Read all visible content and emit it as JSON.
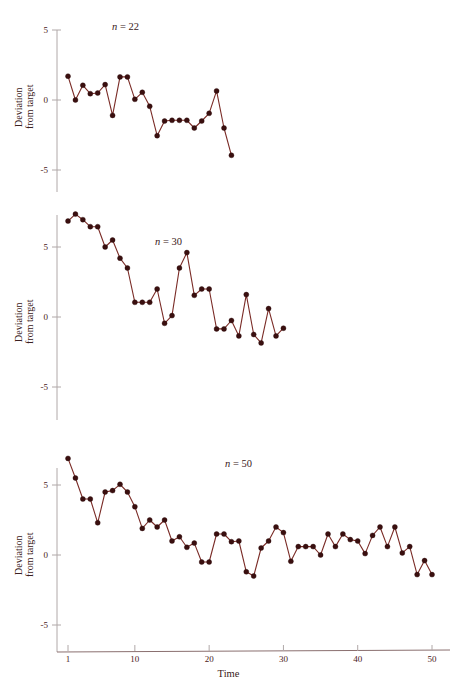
{
  "figure": {
    "xlabel": "Time",
    "ylabel_line1": "Deviation",
    "ylabel_line2": "from target"
  },
  "chart_data": [
    {
      "type": "line",
      "title": "n = 22",
      "title_var": "n",
      "title_rest": " = 22",
      "n": 22,
      "xlabel": "",
      "ylabel": "Deviation from target",
      "xlim": [
        1,
        50
      ],
      "ylim": [
        -7.2,
        7.2
      ],
      "yticks": [
        5,
        0,
        -5
      ],
      "ytick_labels": [
        "5",
        "0",
        "-5"
      ],
      "grid": false,
      "legend": "none",
      "x": [
        1,
        2,
        3,
        4,
        5,
        6,
        7,
        8,
        9,
        10,
        11,
        12,
        13,
        14,
        15,
        16,
        17,
        18,
        19,
        20,
        21,
        22
      ],
      "values": [
        1.7,
        0.0,
        1.05,
        0.45,
        0.5,
        1.1,
        -1.1,
        1.65,
        1.65,
        0.05,
        0.55,
        -0.45,
        -2.55,
        -1.5,
        -1.45,
        -1.45,
        -1.45,
        -2.0,
        -1.5,
        -0.95,
        0.65,
        -2.0
      ],
      "extra_point": {
        "x": 23,
        "value": -3.95
      }
    },
    {
      "type": "line",
      "title": "n = 30",
      "title_var": "n",
      "title_rest": " = 30",
      "n": 30,
      "xlabel": "",
      "ylabel": "Deviation from target",
      "xlim": [
        1,
        50
      ],
      "ylim": [
        -7.2,
        7.2
      ],
      "yticks": [
        5,
        0,
        -5
      ],
      "ytick_labels": [
        "5",
        "0",
        "-5"
      ],
      "grid": false,
      "legend": "none",
      "x": [
        1,
        2,
        3,
        4,
        5,
        6,
        7,
        8,
        9,
        10,
        11,
        12,
        13,
        14,
        15,
        16,
        17,
        18,
        19,
        20,
        21,
        22,
        23,
        24,
        25,
        26,
        27,
        28,
        29,
        30
      ],
      "values": [
        6.85,
        7.35,
        6.95,
        6.45,
        6.45,
        5.0,
        5.5,
        4.2,
        3.5,
        1.05,
        1.05,
        1.05,
        2.0,
        -0.45,
        0.1,
        3.5,
        4.6,
        1.55,
        2.0,
        2.0,
        -0.85,
        -0.85,
        -0.25,
        -1.35,
        1.6,
        -1.25,
        -1.85,
        0.6,
        -1.35,
        -0.8
      ]
    },
    {
      "type": "line",
      "title": "n = 50",
      "title_var": "n",
      "title_rest": " = 50",
      "n": 50,
      "xlabel": "Time",
      "ylabel": "Deviation from target",
      "xlim": [
        1,
        50
      ],
      "ylim": [
        -7.2,
        7.2
      ],
      "yticks": [
        5,
        0,
        -5
      ],
      "ytick_labels": [
        "5",
        "0",
        "-5"
      ],
      "xticks": [
        1,
        10,
        20,
        30,
        40,
        50
      ],
      "xtick_labels": [
        "1",
        "10",
        "20",
        "30",
        "40",
        "50"
      ],
      "grid": false,
      "legend": "none",
      "x": [
        1,
        2,
        3,
        4,
        5,
        6,
        7,
        8,
        9,
        10,
        11,
        12,
        13,
        14,
        15,
        16,
        17,
        18,
        19,
        20,
        21,
        22,
        23,
        24,
        25,
        26,
        27,
        28,
        29,
        30,
        31,
        32,
        33,
        34,
        35,
        36,
        37,
        38,
        39,
        40,
        41,
        42,
        43,
        44,
        45,
        46,
        47,
        48,
        49,
        50
      ],
      "values": [
        6.9,
        5.5,
        4.0,
        4.0,
        2.3,
        4.5,
        4.6,
        5.05,
        4.5,
        3.45,
        1.9,
        2.5,
        2.0,
        2.5,
        1.0,
        1.3,
        0.55,
        0.85,
        -0.5,
        -0.5,
        1.5,
        1.5,
        0.95,
        1.0,
        -1.2,
        -1.5,
        0.5,
        1.0,
        2.0,
        1.6,
        -0.45,
        0.6,
        0.6,
        0.6,
        0.0,
        1.5,
        0.6,
        1.5,
        1.1,
        1.0,
        0.1,
        1.4,
        2.0,
        0.6,
        2.0,
        0.15,
        0.6,
        -1.4,
        -0.4,
        -1.4
      ]
    }
  ],
  "colors": {
    "line": "#7a2b26",
    "marker": "#3a0f0f",
    "axis": "#b0a8a8",
    "xaxis": "#8a6f6f",
    "text": "#3a2020",
    "background": "#ffffff"
  }
}
